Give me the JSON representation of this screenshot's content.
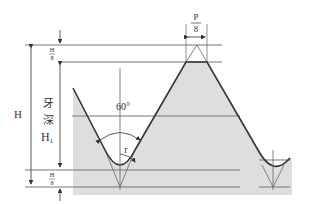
{
  "diagram": {
    "colors": {
      "fill": "#dedede",
      "line": "#444444",
      "thin": "#777777"
    },
    "labels": {
      "crest_width_num": "P",
      "crest_width_den": "8",
      "top_trunc_num": "H",
      "top_trunc_den": "8",
      "bottom_trunc_num": "H",
      "bottom_trunc_den": "8",
      "total_height": "H",
      "depth_char1": "牙",
      "depth_char2": "深",
      "depth_symbol": "H",
      "depth_subscript": "1",
      "angle": "60°",
      "radius": "r"
    }
  }
}
